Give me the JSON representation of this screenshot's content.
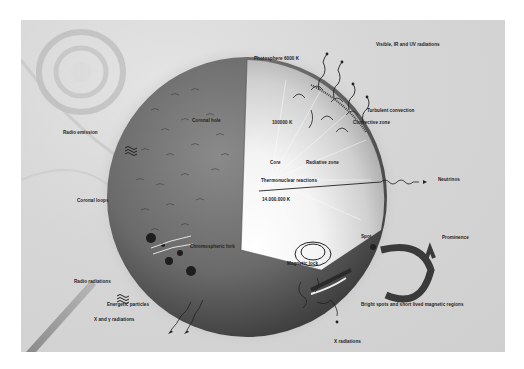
{
  "labels": {
    "visible_ir_uv": "Visible, IR and UV radiations",
    "photosphere": "Photosphere 6000 K",
    "turbulent_convection": "Turbulent convection",
    "convective_zone": "Convective zone",
    "radio_emission": "Radio emission",
    "coronal_hole": "Coronal hole",
    "temp_100000": "100000 K",
    "core": "Core",
    "radiative_zone": "Radiative zone",
    "thermonuclear": "Thermonuclear reactions",
    "temp_core": "14.000.000 K",
    "neutrinos": "Neutrinos",
    "coronal_loops": "Coronal loops",
    "prominence": "Prominence",
    "spot": "Spot",
    "chromospheric_fork": "Chromospheric fork",
    "magnetic_lock": "Magnetic lock",
    "radio_radiations": "Radio radiations",
    "energetic_particles": "Energetic particles",
    "x_gamma": "X and γ radiations",
    "bright_spots": "Bright spots and short lived magnetic regions",
    "x_radiations": "X radiations"
  },
  "colors": {
    "background": "#d4d4d4",
    "sphere_dark": "#4a4a4a",
    "sphere_mid": "#7a7a7a",
    "core_light": "#ffffff",
    "ink": "#222222"
  }
}
